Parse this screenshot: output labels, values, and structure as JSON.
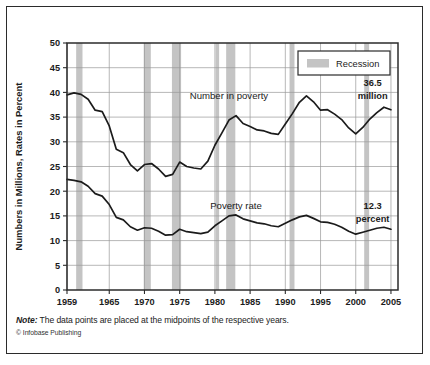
{
  "figure": {
    "note_prefix": "Note:",
    "note_text": " The data points are placed at the midpoints of the respective years.",
    "credit": "© Infobase Publishing"
  },
  "colors": {
    "line": "#1b1b1b",
    "recession_band": "#c4c4c4",
    "grid": "#9a9a9a",
    "frame": "#2b2b2b",
    "background": "#ffffff"
  },
  "chart_data": {
    "type": "line",
    "title": "",
    "xlabel": "",
    "ylabel": "Numbers in Millions, Rates in Percent",
    "xlim": [
      1959,
      2006
    ],
    "ylim": [
      0,
      50
    ],
    "grid": true,
    "legend_position": "top-right",
    "xticks": [
      1959,
      1965,
      1970,
      1975,
      1980,
      1985,
      1990,
      1995,
      2000,
      2005
    ],
    "yticks": [
      0,
      5,
      10,
      15,
      20,
      25,
      30,
      35,
      40,
      45,
      50
    ],
    "legend": [
      {
        "label": "Recession",
        "swatch": "#c4c4c4"
      }
    ],
    "annotations": [
      {
        "text": "Number in poverty",
        "x": 1982.0,
        "y": 38.6,
        "kind": "series-label"
      },
      {
        "text": "Poverty rate",
        "x": 1983.0,
        "y": 16.4,
        "kind": "series-label"
      },
      {
        "text": "36.5",
        "x": 2002.4,
        "y": 41.2,
        "kind": "value-label"
      },
      {
        "text": "million",
        "x": 2002.4,
        "y": 38.6,
        "kind": "value-label"
      },
      {
        "text": "12.3",
        "x": 2002.4,
        "y": 16.3,
        "kind": "value-label"
      },
      {
        "text": "percent",
        "x": 2002.4,
        "y": 13.7,
        "kind": "value-label"
      }
    ],
    "recessions": [
      {
        "start": 1960.3,
        "end": 1961.2
      },
      {
        "start": 1969.9,
        "end": 1970.9
      },
      {
        "start": 1973.9,
        "end": 1975.2
      },
      {
        "start": 1980.1,
        "end": 1980.6
      },
      {
        "start": 1981.6,
        "end": 1982.9
      },
      {
        "start": 1990.6,
        "end": 1991.3
      },
      {
        "start": 2001.2,
        "end": 2001.9
      }
    ],
    "x": [
      1959,
      1960,
      1961,
      1962,
      1963,
      1964,
      1965,
      1966,
      1967,
      1968,
      1969,
      1970,
      1971,
      1972,
      1973,
      1974,
      1975,
      1976,
      1977,
      1978,
      1979,
      1980,
      1981,
      1982,
      1983,
      1984,
      1985,
      1986,
      1987,
      1988,
      1989,
      1990,
      1991,
      1992,
      1993,
      1994,
      1995,
      1996,
      1997,
      1998,
      1999,
      2000,
      2001,
      2002,
      2003,
      2004,
      2005
    ],
    "series": [
      {
        "name": "Number in poverty",
        "unit": "millions",
        "last_value": 36.5,
        "values": [
          39.5,
          39.9,
          39.6,
          38.6,
          36.4,
          36.1,
          33.2,
          28.5,
          27.8,
          25.4,
          24.1,
          25.4,
          25.6,
          24.5,
          23.0,
          23.4,
          25.9,
          25.0,
          24.7,
          24.5,
          26.1,
          29.3,
          31.8,
          34.4,
          35.3,
          33.7,
          33.1,
          32.4,
          32.2,
          31.7,
          31.5,
          33.6,
          35.7,
          38.0,
          39.3,
          38.1,
          36.4,
          36.5,
          35.6,
          34.5,
          32.8,
          31.6,
          32.9,
          34.6,
          35.9,
          37.0,
          36.5
        ]
      },
      {
        "name": "Poverty rate",
        "unit": "percent",
        "last_value": 12.3,
        "values": [
          22.4,
          22.2,
          21.9,
          21.0,
          19.5,
          19.0,
          17.3,
          14.7,
          14.2,
          12.8,
          12.1,
          12.6,
          12.5,
          11.9,
          11.1,
          11.2,
          12.3,
          11.8,
          11.6,
          11.4,
          11.7,
          13.0,
          14.0,
          15.0,
          15.2,
          14.4,
          14.0,
          13.6,
          13.4,
          13.0,
          12.8,
          13.5,
          14.2,
          14.8,
          15.1,
          14.5,
          13.8,
          13.7,
          13.3,
          12.7,
          11.9,
          11.3,
          11.7,
          12.1,
          12.5,
          12.7,
          12.3
        ]
      }
    ]
  }
}
